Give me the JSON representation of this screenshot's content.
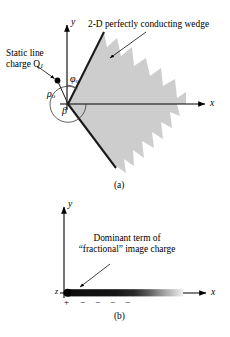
{
  "figure": {
    "panels": [
      {
        "id": "a",
        "caption": "(a)",
        "axis_x_label": "x",
        "axis_y_label": "y",
        "annotations": {
          "line_charge_label": "Static line charge Q",
          "line_charge_subscript": "1",
          "wedge_label": "2-D perfectly conducting wedge",
          "rho_symbol": "ρ",
          "rho_subscript": "o",
          "phi_symbol": "φ",
          "phi_subscript": "o",
          "beta_symbol": "β"
        }
      },
      {
        "id": "b",
        "caption": "(b)",
        "axis_x_label": "x",
        "axis_y_label": "y",
        "origin_label": "z",
        "annotations": {
          "image_charge_line1": "Dominant term of",
          "image_charge_line2": "“fractional” image charge",
          "charge_signs": [
            "+",
            "−",
            "−",
            "−",
            "−"
          ]
        }
      }
    ],
    "colors": {
      "ink": "#000000",
      "wedge_fill": "#c8c8c8",
      "wedge_edge": "#1a1a1a",
      "background": "#ffffff",
      "bar_dark": "#111111",
      "bar_fade": "#d8d8d8"
    }
  }
}
